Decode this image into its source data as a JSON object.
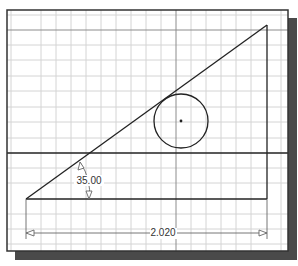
{
  "drawing": {
    "title": "Sketch with triangle, tangent circle, and dimensions",
    "colors": {
      "background": "#ffffff",
      "frame": "#333333",
      "shadow": "#4a4a4a",
      "minor_grid": "#d4d4d4",
      "major_grid": "#8c8c8c",
      "geometry": "#222222",
      "dimension": "#666666"
    },
    "frame": {
      "x": 7,
      "y": 10,
      "width": 281,
      "height": 241
    },
    "grid": {
      "minor_spacing": 15,
      "major_x": [
        26,
        176
      ],
      "major_y": [
        30,
        153
      ]
    },
    "triangle": {
      "vertices": [
        [
          26,
          199
        ],
        [
          267,
          25
        ],
        [
          267,
          199
        ]
      ]
    },
    "reference_line": {
      "y": 153,
      "x1": 7,
      "x2": 288
    },
    "circle": {
      "cx": 181,
      "cy": 121,
      "r": 27,
      "center_marker": true
    },
    "angle_dimension": {
      "label": "35.00",
      "x": 88,
      "y": 184
    },
    "linear_dimension": {
      "label": "2.020",
      "x": 163,
      "y": 236,
      "y_line": 233,
      "x1": 26,
      "x2": 267
    }
  }
}
